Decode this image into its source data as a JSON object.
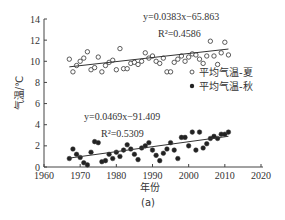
{
  "chart_data": {
    "type": "scatter",
    "title": "",
    "xlabel": "年份",
    "ylabel": "气温/℃",
    "caption": "(a)",
    "xlim": [
      1960,
      2020
    ],
    "ylim": [
      0,
      14
    ],
    "xticks": [
      1960,
      1970,
      1980,
      1990,
      2000,
      2010,
      2020
    ],
    "yticks": [
      0,
      2,
      4,
      6,
      8,
      10,
      12,
      14
    ],
    "grid": false,
    "legend_position": "right-middle",
    "series": [
      {
        "name": "平均气温-夏",
        "marker": "open-circle",
        "trendline": {
          "equation": "y=0.0383x−65.863",
          "r2": "R²=0.4586",
          "slope": 0.0383,
          "intercept": -65.863
        },
        "x": [
          1967,
          1968,
          1969,
          1970,
          1971,
          1972,
          1973,
          1974,
          1975,
          1976,
          1977,
          1978,
          1979,
          1980,
          1981,
          1982,
          1983,
          1984,
          1985,
          1986,
          1987,
          1988,
          1989,
          1990,
          1991,
          1992,
          1993,
          1994,
          1995,
          1996,
          1997,
          1998,
          1999,
          2000,
          2001,
          2002,
          2003,
          2004,
          2005,
          2006,
          2007,
          2008,
          2009,
          2010,
          2011
        ],
        "values": [
          10.2,
          9.0,
          9.6,
          10.0,
          10.3,
          10.9,
          9.2,
          9.4,
          10.4,
          9.0,
          9.6,
          9.9,
          10.1,
          9.2,
          11.2,
          9.3,
          9.3,
          9.8,
          9.9,
          9.7,
          10.0,
          10.8,
          10.3,
          10.5,
          10.0,
          9.8,
          10.3,
          9.0,
          9.0,
          9.9,
          10.2,
          10.5,
          10.0,
          10.4,
          10.7,
          10.6,
          10.2,
          9.8,
          10.5,
          11.9,
          10.5,
          9.7,
          10.8,
          11.8,
          10.6
        ]
      },
      {
        "name": "平均气温-秋",
        "marker": "filled-circle",
        "trendline": {
          "equation": "y=0.0469x−91.409",
          "r2": "R²=0.5309",
          "slope": 0.0469,
          "intercept": -91.409
        },
        "x": [
          1967,
          1968,
          1969,
          1970,
          1971,
          1972,
          1973,
          1974,
          1975,
          1976,
          1977,
          1978,
          1979,
          1980,
          1981,
          1982,
          1983,
          1984,
          1985,
          1986,
          1987,
          1988,
          1989,
          1990,
          1991,
          1992,
          1993,
          1994,
          1995,
          1996,
          1997,
          1998,
          1999,
          2000,
          2001,
          2002,
          2003,
          2004,
          2005,
          2006,
          2007,
          2008,
          2009,
          2010,
          2011
        ],
        "values": [
          0.8,
          1.7,
          1.2,
          0.9,
          0.4,
          0.2,
          1.4,
          2.4,
          2.3,
          0.5,
          0.6,
          1.2,
          0.8,
          1.4,
          1.0,
          1.6,
          2.1,
          1.7,
          1.2,
          0.7,
          1.8,
          2.0,
          2.3,
          1.6,
          1.1,
          0.6,
          1.3,
          1.7,
          2.3,
          1.6,
          0.8,
          2.8,
          2.8,
          2.0,
          3.3,
          1.6,
          3.3,
          1.8,
          2.2,
          2.7,
          2.9,
          2.7,
          3.1,
          3.1,
          3.3
        ]
      }
    ]
  }
}
